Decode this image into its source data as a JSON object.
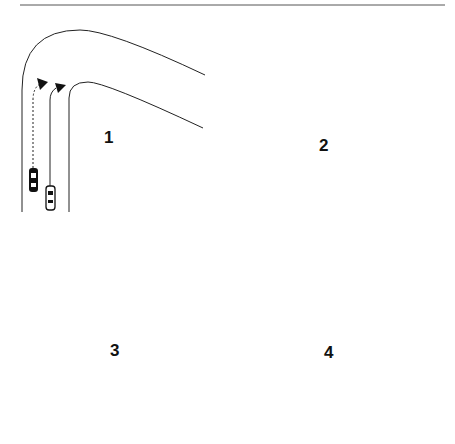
{
  "diagram": {
    "type": "racing-line-overtake-sequence",
    "top_rule": true,
    "colors": {
      "line": "#222222",
      "background": "#ffffff",
      "dark_car": "#111111",
      "light_car": "#ffffff"
    },
    "panels": [
      {
        "label": "1",
        "description": "Two cars approach corner on straight; dark car (dotted path) on outside, light car (solid path) on inside"
      },
      {
        "label": "2",
        "description": "Cars side by side at corner entry; both paths turn right"
      },
      {
        "label": "3",
        "description": "Both cars mid-corner; dark car on outer dotted line, light car on inner solid line"
      },
      {
        "label": "4",
        "description": "Corner exit; light car pushed wide toward outer edge, dark car follows dotted line"
      }
    ]
  }
}
